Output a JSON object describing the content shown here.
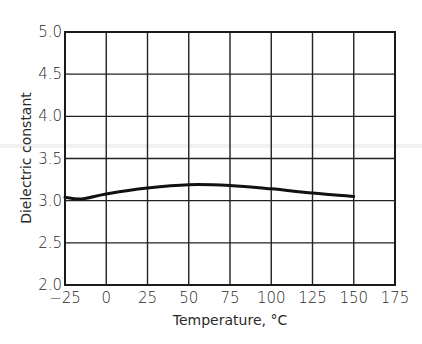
{
  "chart_data": {
    "type": "line",
    "title": "",
    "xlabel": "Temperature, °C",
    "ylabel": "Dielectric constant",
    "xlim": [
      -25,
      175
    ],
    "ylim": [
      2.0,
      5.0
    ],
    "grid": true,
    "x_ticks": [
      -25,
      0,
      25,
      50,
      75,
      100,
      125,
      150,
      175
    ],
    "x_tick_labels": [
      "−25",
      "0",
      "25",
      "50",
      "75",
      "100",
      "125",
      "150",
      "175"
    ],
    "y_ticks": [
      2.0,
      2.5,
      3.0,
      3.5,
      4.0,
      4.5,
      5.0
    ],
    "y_tick_labels": [
      "2.0",
      "2.5",
      "3.0",
      "3.5",
      "4.0",
      "4.5",
      "5.0"
    ],
    "series": [
      {
        "name": "Dielectric constant",
        "x": [
          -25,
          -15,
          0,
          25,
          50,
          75,
          100,
          125,
          150
        ],
        "y": [
          3.04,
          3.02,
          3.08,
          3.15,
          3.19,
          3.18,
          3.14,
          3.09,
          3.05
        ]
      }
    ]
  }
}
